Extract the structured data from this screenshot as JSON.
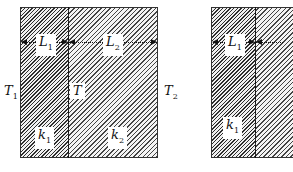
{
  "left_figure": {
    "outer_left_temp": {
      "symbol": "T",
      "sub": "1"
    },
    "outer_right_temp": {
      "symbol": "T",
      "sub": "2"
    },
    "interface_temp": {
      "symbol": "T",
      "sub": ""
    },
    "layer1": {
      "length": {
        "symbol": "L",
        "sub": "1"
      },
      "conductivity": {
        "symbol": "k",
        "sub": "1"
      }
    },
    "layer2": {
      "length": {
        "symbol": "L",
        "sub": "2"
      },
      "conductivity": {
        "symbol": "k",
        "sub": "2"
      }
    }
  },
  "right_figure": {
    "layer1": {
      "length": {
        "symbol": "L",
        "sub": "1"
      },
      "conductivity": {
        "symbol": "k",
        "sub": "1"
      }
    }
  }
}
